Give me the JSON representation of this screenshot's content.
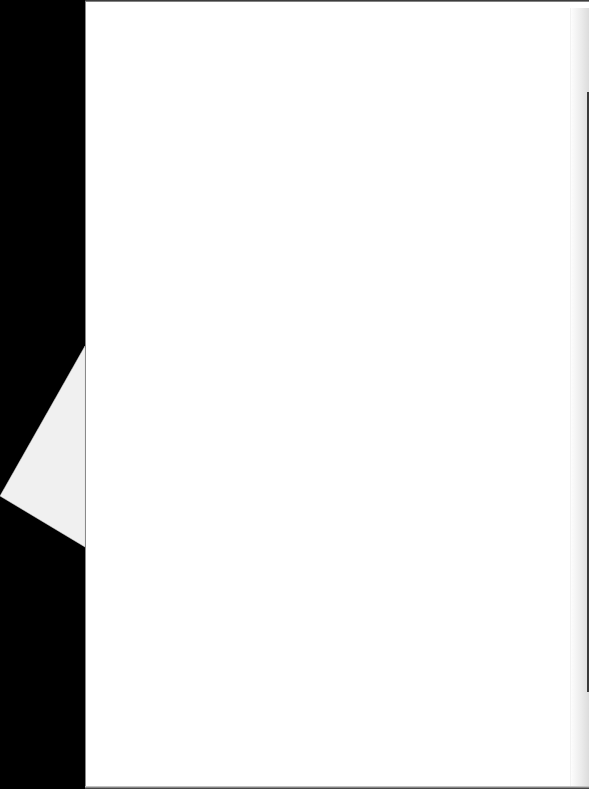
{
  "document": {
    "type": "scanned-page",
    "content": "",
    "colors": {
      "background": "#000000",
      "page": "#ffffff",
      "folded_corner": "#f0f0f0",
      "back_sheet": "#e6e6e6"
    }
  }
}
